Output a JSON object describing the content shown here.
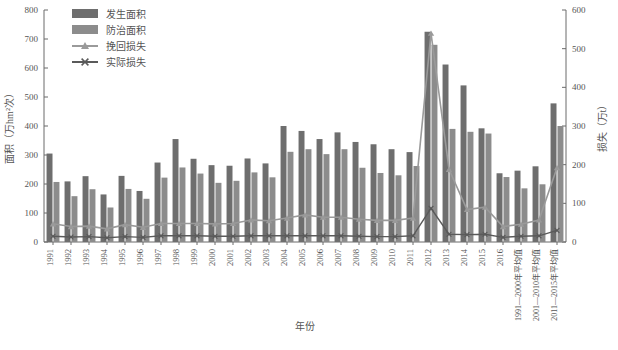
{
  "chart_data": {
    "type": "bar",
    "title": "",
    "xlabel": "年份",
    "ylabel": "面积（万hm²次）",
    "y2label": "损失（万t）",
    "ylim": [
      0,
      800
    ],
    "y2lim": [
      0,
      600
    ],
    "yticks": [
      "0",
      "100",
      "200",
      "300",
      "400",
      "500",
      "600",
      "700",
      "800"
    ],
    "y2ticks": [
      "0",
      "100",
      "200",
      "300",
      "400",
      "500",
      "600"
    ],
    "grid": false,
    "legend_position": "top-left",
    "categories": [
      "1991",
      "1992",
      "1993",
      "1994",
      "1995",
      "1996",
      "1997",
      "1998",
      "1999",
      "2000",
      "2001",
      "2002",
      "2003",
      "2004",
      "2005",
      "2006",
      "2007",
      "2008",
      "2009",
      "2010",
      "2011",
      "2012",
      "2013",
      "2014",
      "2015",
      "2016",
      "1991—2000年平均值",
      "2001—2010年平均值",
      "2011—2015年平均值"
    ],
    "series": [
      {
        "name": "发生面积",
        "axis": "left",
        "unit": "万hm²次",
        "color": "#6e6e6e",
        "kind": "bar",
        "values": [
          305,
          209,
          227,
          164,
          228,
          176,
          274,
          355,
          287,
          265,
          263,
          288,
          271,
          400,
          383,
          355,
          378,
          345,
          337,
          320,
          310,
          725,
          612,
          540,
          392,
          237,
          246,
          261,
          478
        ]
      },
      {
        "name": "防治面积",
        "axis": "left",
        "unit": "万hm²次",
        "color": "#8c8c8c",
        "kind": "bar",
        "values": [
          207,
          158,
          182,
          119,
          183,
          149,
          222,
          257,
          236,
          204,
          211,
          240,
          223,
          311,
          320,
          303,
          320,
          256,
          238,
          230,
          262,
          680,
          390,
          380,
          374,
          224,
          185,
          199,
          400
        ]
      },
      {
        "name": "挽回损失",
        "axis": "right",
        "unit": "万t",
        "color": "#9a9a9a",
        "kind": "line",
        "marker": "triangle",
        "values": [
          47,
          40,
          41,
          34,
          45,
          38,
          48,
          48,
          48,
          47,
          48,
          57,
          55,
          62,
          70,
          64,
          64,
          59,
          56,
          56,
          62,
          540,
          188,
          84,
          90,
          40,
          46,
          57,
          192
        ]
      },
      {
        "name": "实际损失",
        "axis": "right",
        "unit": "万t",
        "color": "#5a5a5a",
        "kind": "line",
        "marker": "x",
        "values": [
          15,
          13,
          14,
          11,
          14,
          12,
          16,
          16,
          16,
          15,
          15,
          16,
          16,
          16,
          16,
          16,
          16,
          15,
          14,
          14,
          16,
          87,
          20,
          19,
          20,
          12,
          15,
          16,
          30
        ]
      }
    ]
  },
  "legend": {
    "items": [
      {
        "label": "发生面积",
        "type": "bar",
        "color": "#6e6e6e"
      },
      {
        "label": "防治面积",
        "type": "bar",
        "color": "#8c8c8c"
      },
      {
        "label": "挽回损失",
        "type": "line-triangle",
        "color": "#9a9a9a"
      },
      {
        "label": "实际损失",
        "type": "line-x",
        "color": "#5a5a5a"
      }
    ]
  }
}
